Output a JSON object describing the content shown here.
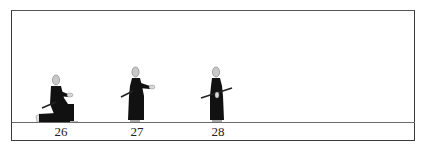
{
  "diagram": {
    "type": "sequential-figure-illustration",
    "figures": [
      {
        "number": "26",
        "pose": "kneeling, sword drawn low at side, left hand forward"
      },
      {
        "number": "27",
        "pose": "standing, sword held low at left side, right hand forward"
      },
      {
        "number": "28",
        "pose": "standing, sword held horizontally across body at waist"
      }
    ],
    "colors": {
      "robe": "#111111",
      "head": "#c8c8c8",
      "frame": "#3a3a3a",
      "floor": "#6a6a6a",
      "background": "#ffffff"
    }
  }
}
